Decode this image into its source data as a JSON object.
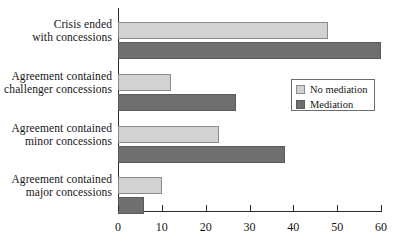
{
  "chart_data": {
    "type": "bar",
    "orientation": "horizontal",
    "title": "",
    "xlabel": "",
    "ylabel": "",
    "xlim": [
      0,
      60
    ],
    "xticks": [
      0,
      10,
      20,
      30,
      40,
      50,
      60
    ],
    "grid": false,
    "legend_position": "middle-right",
    "categories": [
      "Crisis ended with concessions",
      "Agreement contained challenger concessions",
      "Agreement contained minor concessions",
      "Agreement contained major concessions"
    ],
    "category_lines": [
      [
        "Crisis ended",
        "with concessions"
      ],
      [
        "Agreement contained",
        "challenger concessions"
      ],
      [
        "Agreement contained",
        "minor concessions"
      ],
      [
        "Agreement contained",
        "major concessions"
      ]
    ],
    "series": [
      {
        "name": "No mediation",
        "color": "#d2d2d2",
        "values": [
          48,
          12,
          23,
          10
        ]
      },
      {
        "name": "Mediation",
        "color": "#6f6f6f",
        "values": [
          60,
          27,
          38,
          6
        ]
      }
    ]
  },
  "legend": {
    "items": [
      {
        "label": "No mediation",
        "swatch": "light"
      },
      {
        "label": "Mediation",
        "swatch": "dark"
      }
    ]
  },
  "axis": {
    "tick_labels": [
      "0",
      "10",
      "20",
      "30",
      "40",
      "50",
      "60"
    ]
  },
  "colors": {
    "no_mediation": "#d2d2d2",
    "mediation": "#6f6f6f",
    "axis": "#2b2b2b",
    "background": "#ffffff"
  }
}
